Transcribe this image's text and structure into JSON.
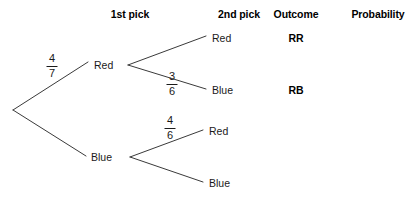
{
  "diagram": {
    "type": "probability-tree",
    "title": "",
    "headers": [
      {
        "label": "1st pick",
        "x": 130,
        "y": 8
      },
      {
        "label": "2nd pick",
        "x": 239,
        "y": 8
      },
      {
        "label": "Outcome",
        "x": 296,
        "y": 8
      },
      {
        "label": "Probability",
        "x": 378,
        "y": 8
      }
    ],
    "root": {
      "x": 13,
      "y": 110
    },
    "level1": [
      {
        "id": "red1",
        "label": "Red",
        "x": 94,
        "y": 65,
        "branch_x": 128,
        "fraction": {
          "numerator": "4",
          "denominator": "7"
        },
        "frac_x": 52,
        "frac_y": 66
      },
      {
        "id": "blue1",
        "label": "Blue",
        "x": 91,
        "y": 157,
        "branch_x": 130,
        "fraction": {
          "numerator": "",
          "denominator": ""
        },
        "frac_x": 0,
        "frac_y": 0
      }
    ],
    "level2": [
      {
        "id": "red-red",
        "parent": "red1",
        "label": "Red",
        "x": 212,
        "y": 38,
        "fraction": {
          "numerator": "",
          "denominator": ""
        },
        "frac_x": 0,
        "frac_y": 0
      },
      {
        "id": "red-blue",
        "parent": "red1",
        "label": "Blue",
        "x": 212,
        "y": 90,
        "fraction": {
          "numerator": "3",
          "denominator": "6"
        },
        "frac_x": 172,
        "frac_y": 84
      },
      {
        "id": "blue-red",
        "parent": "blue1",
        "label": "Red",
        "x": 209,
        "y": 131,
        "fraction": {
          "numerator": "4",
          "denominator": "6"
        },
        "frac_x": 170,
        "frac_y": 128
      },
      {
        "id": "blue-blue",
        "parent": "blue1",
        "label": "Blue",
        "x": 209,
        "y": 183,
        "fraction": {
          "numerator": "",
          "denominator": ""
        },
        "frac_x": 0,
        "frac_y": 0
      }
    ],
    "outcomes": [
      {
        "id": "outcome-rr",
        "label": "RR",
        "x": 296,
        "y": 38
      },
      {
        "id": "outcome-rb",
        "label": "RB",
        "x": 296,
        "y": 90
      },
      {
        "id": "outcome-br",
        "label": "",
        "x": 296,
        "y": 131
      },
      {
        "id": "outcome-bb",
        "label": "",
        "x": 296,
        "y": 183
      }
    ],
    "probabilities": [
      {
        "id": "prob-rr",
        "label": "",
        "x": 378,
        "y": 38
      },
      {
        "id": "prob-rb",
        "label": "",
        "x": 378,
        "y": 90
      },
      {
        "id": "prob-br",
        "label": "",
        "x": 378,
        "y": 131
      },
      {
        "id": "prob-bb",
        "label": "",
        "x": 378,
        "y": 183
      }
    ],
    "colors": {
      "line": "#3a3a3a",
      "text": "#1a1a1a",
      "header_text": "#000000",
      "background": "#ffffff"
    },
    "edges": [
      {
        "id": "edge-root-red",
        "x1": 13,
        "y1": 110,
        "x2": 88,
        "y2": 62
      },
      {
        "id": "edge-root-blue",
        "x1": 13,
        "y1": 110,
        "x2": 86,
        "y2": 156
      },
      {
        "id": "edge-red-red",
        "x1": 128,
        "y1": 65,
        "x2": 206,
        "y2": 36
      },
      {
        "id": "edge-red-blue",
        "x1": 128,
        "y1": 65,
        "x2": 206,
        "y2": 89
      },
      {
        "id": "edge-blue-red",
        "x1": 130,
        "y1": 157,
        "x2": 203,
        "y2": 130
      },
      {
        "id": "edge-blue-blue",
        "x1": 130,
        "y1": 157,
        "x2": 203,
        "y2": 182
      }
    ]
  }
}
